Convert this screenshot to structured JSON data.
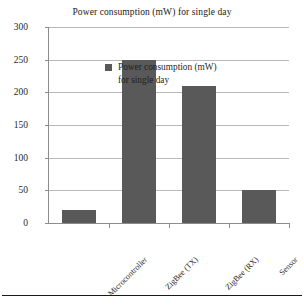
{
  "chart_data": {
    "type": "bar",
    "title": "Power consumption (mW) for single day",
    "xlabel": "",
    "ylabel": "",
    "categories": [
      "Microcontroller",
      "ZigBee (TX)",
      "ZigBee (RX)",
      "Sensor"
    ],
    "values": [
      20,
      250,
      210,
      50
    ],
    "series": [
      {
        "name": "Power consumption (mW) for single day",
        "values": [
          20,
          250,
          210,
          50
        ]
      }
    ],
    "ylim": [
      0,
      300
    ],
    "yticks": [
      0,
      50,
      100,
      150,
      200,
      250,
      300
    ],
    "ytick_labels": [
      "0",
      "50",
      "100",
      "150",
      "200",
      "250",
      "300"
    ],
    "grid": true,
    "grid_axis": "y",
    "legend": {
      "position": "inside-top-left",
      "entries": [
        {
          "line1": "Power consumption (mW)",
          "line2": "for single day",
          "color": "#595959"
        }
      ]
    },
    "colors": {
      "bar_fill": "#595959",
      "gridline": "#b9b9b9",
      "axis": "#8c8c8c",
      "text": "#1f1f1f",
      "background": "#ffffff",
      "bottom_rule": "#1a1a1a"
    }
  }
}
